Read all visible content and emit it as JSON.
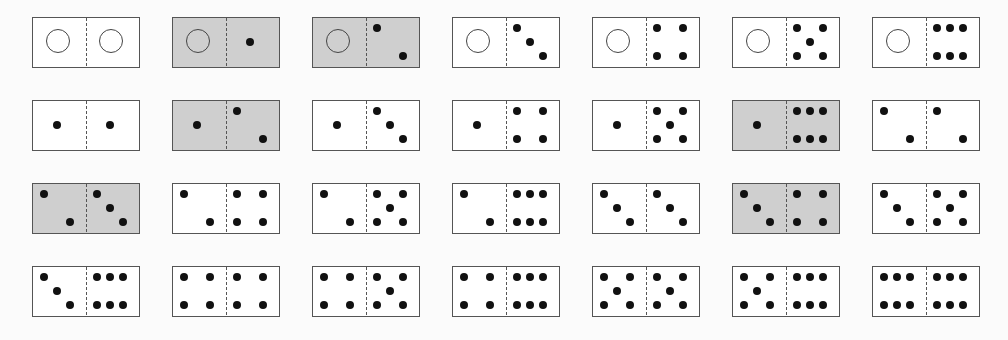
{
  "board": {
    "title": "Double-six domino set",
    "layout": {
      "columns": 7,
      "rows": 4,
      "origin_x": 32,
      "origin_y": 17,
      "col_step": 140,
      "row_step": 83
    },
    "colors": {
      "highlight": "#cfcfcf",
      "normal": "#ffffff",
      "pip": "#111111",
      "border": "#555555"
    },
    "blank_icon": "hollow-circle",
    "dominoes": [
      {
        "left": 0,
        "right": 0,
        "highlighted": false
      },
      {
        "left": 0,
        "right": 1,
        "highlighted": true
      },
      {
        "left": 0,
        "right": 2,
        "highlighted": true
      },
      {
        "left": 0,
        "right": 3,
        "highlighted": false
      },
      {
        "left": 0,
        "right": 4,
        "highlighted": false
      },
      {
        "left": 0,
        "right": 5,
        "highlighted": false
      },
      {
        "left": 0,
        "right": 6,
        "highlighted": false
      },
      {
        "left": 1,
        "right": 1,
        "highlighted": false
      },
      {
        "left": 1,
        "right": 2,
        "highlighted": true
      },
      {
        "left": 1,
        "right": 3,
        "highlighted": false
      },
      {
        "left": 1,
        "right": 4,
        "highlighted": false
      },
      {
        "left": 1,
        "right": 5,
        "highlighted": false
      },
      {
        "left": 1,
        "right": 6,
        "highlighted": true
      },
      {
        "left": 2,
        "right": 2,
        "highlighted": false
      },
      {
        "left": 2,
        "right": 3,
        "highlighted": true
      },
      {
        "left": 2,
        "right": 4,
        "highlighted": false
      },
      {
        "left": 2,
        "right": 5,
        "highlighted": false
      },
      {
        "left": 2,
        "right": 6,
        "highlighted": false
      },
      {
        "left": 3,
        "right": 3,
        "highlighted": false
      },
      {
        "left": 3,
        "right": 4,
        "highlighted": true
      },
      {
        "left": 3,
        "right": 5,
        "highlighted": false
      },
      {
        "left": 3,
        "right": 6,
        "highlighted": false
      },
      {
        "left": 4,
        "right": 4,
        "highlighted": false
      },
      {
        "left": 4,
        "right": 5,
        "highlighted": false
      },
      {
        "left": 4,
        "right": 6,
        "highlighted": false
      },
      {
        "left": 5,
        "right": 5,
        "highlighted": false
      },
      {
        "left": 5,
        "right": 6,
        "highlighted": false
      },
      {
        "left": 6,
        "right": 6,
        "highlighted": false
      }
    ]
  }
}
